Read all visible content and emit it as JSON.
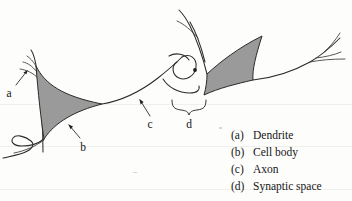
{
  "figure": {
    "background_color": "#fdfdfc",
    "soma_fill_color": "#9a9a9a",
    "stroke_color": "#2b2b2b"
  },
  "callouts": [
    {
      "key": "a",
      "label": "a",
      "target": "dendrite-left"
    },
    {
      "key": "b",
      "label": "b",
      "target": "cell-body-left"
    },
    {
      "key": "c",
      "label": "c",
      "target": "axon"
    },
    {
      "key": "d",
      "label": "d",
      "target": "synaptic-space"
    }
  ],
  "legend": {
    "items": [
      {
        "key": "(a)",
        "label": "Dendrite"
      },
      {
        "key": "(b)",
        "label": "Cell body"
      },
      {
        "key": "(c)",
        "label": "Axon"
      },
      {
        "key": "(d)",
        "label": "Synaptic space"
      }
    ]
  }
}
